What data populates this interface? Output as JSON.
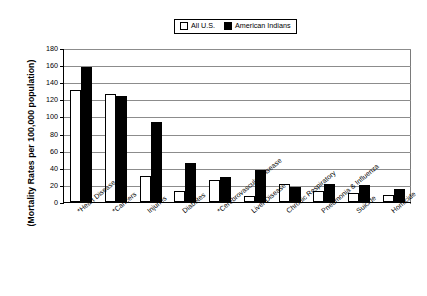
{
  "chart_data": {
    "type": "bar",
    "title": "",
    "xlabel": "",
    "ylabel": "(Mortality Rates per 100,000 population)",
    "ylim": [
      0,
      180
    ],
    "yticks": [
      0,
      20,
      40,
      60,
      80,
      100,
      120,
      140,
      160,
      180
    ],
    "grid": true,
    "legend_position": "top-center",
    "categories": [
      "*Heart Disease",
      "*Cancers",
      "Injuries",
      "Diabetes",
      "*Cerebrovascular Disease",
      "Liver Disease",
      "Chronic Respiratory",
      "Pneumonia & Influenza",
      "Suicide",
      "Homicide"
    ],
    "series": [
      {
        "name": "All U.S.",
        "color": "#ffffff",
        "values": [
          131,
          126,
          30,
          13,
          26,
          7,
          21,
          13,
          11,
          8
        ]
      },
      {
        "name": "American Indians",
        "color": "#000000",
        "values": [
          158,
          124,
          93,
          46,
          29,
          37,
          17,
          21,
          20,
          15
        ]
      }
    ]
  },
  "legend": {
    "items": [
      {
        "label": "All U.S.",
        "swatch": "hollow-square"
      },
      {
        "label": "American Indians",
        "swatch": "filled-square"
      }
    ]
  }
}
